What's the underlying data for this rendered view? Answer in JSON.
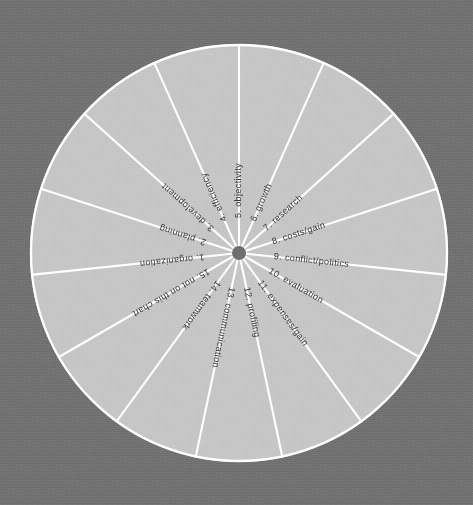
{
  "canvas": {
    "width": 473,
    "height": 505
  },
  "colors": {
    "background": "#727272",
    "wheel_fill": "#c6c6c6",
    "spoke": "#ffffff",
    "rim": "#ffffff",
    "hub": "#6e6e6e",
    "label_text": "#38383a"
  },
  "chart_data": {
    "type": "pie",
    "title": "",
    "subtitle": "",
    "xlabel": "",
    "ylabel": "",
    "legend_position": "none",
    "grid": false,
    "equal_slices": true,
    "slice_count": 15,
    "slice_angle_degrees": 24,
    "start_angle_degrees": 0,
    "center": {
      "x": 239,
      "y": 253
    },
    "radius": 209,
    "hub_radius": 7,
    "categories": [
      "1. organization",
      "2. planning",
      "3. development",
      "4. efficiency",
      "5. objectivity",
      "6. growth",
      "7. research",
      "8. costs/gain",
      "9. conflict/politics",
      "10. evaluation",
      "11. expenses/gain",
      "12. profiling",
      "13. communication",
      "14. teamwork",
      "15. not on this chart"
    ],
    "values": [
      1,
      1,
      1,
      1,
      1,
      1,
      1,
      1,
      1,
      1,
      1,
      1,
      1,
      1,
      1
    ],
    "slices": [
      {
        "number": "1.",
        "label": "organization",
        "text": "1.  organization",
        "value": 1,
        "percent": 6.67,
        "mid_angle_degrees": 264
      },
      {
        "number": "2.",
        "label": "planning",
        "text": "2.  planning",
        "value": 1,
        "percent": 6.67,
        "mid_angle_degrees": 288
      },
      {
        "number": "3.",
        "label": "development",
        "text": "3.  development",
        "value": 1,
        "percent": 6.67,
        "mid_angle_degrees": 312
      },
      {
        "number": "4.",
        "label": "efficiency",
        "text": "4.  efficiency",
        "value": 1,
        "percent": 6.67,
        "mid_angle_degrees": 336
      },
      {
        "number": "5.",
        "label": "objectivity",
        "text": "5.  objectivity",
        "value": 1,
        "percent": 6.67,
        "mid_angle_degrees": 0
      },
      {
        "number": "6.",
        "label": "growth",
        "text": "6.  growth",
        "value": 1,
        "percent": 6.67,
        "mid_angle_degrees": 24
      },
      {
        "number": "7.",
        "label": "research",
        "text": "7.  research",
        "value": 1,
        "percent": 6.67,
        "mid_angle_degrees": 48
      },
      {
        "number": "8.",
        "label": "costs/gain",
        "text": "8.  costs/gain",
        "value": 1,
        "percent": 6.67,
        "mid_angle_degrees": 72
      },
      {
        "number": "9.",
        "label": "conflict/politics",
        "text": "9.  conflict/politics",
        "value": 1,
        "percent": 6.67,
        "mid_angle_degrees": 96
      },
      {
        "number": "10.",
        "label": "evaluation",
        "text": "10.  evaluation",
        "value": 1,
        "percent": 6.67,
        "mid_angle_degrees": 120
      },
      {
        "number": "11.",
        "label": "expenses/gain",
        "text": "11.  expenses/gain",
        "value": 1,
        "percent": 6.67,
        "mid_angle_degrees": 144
      },
      {
        "number": "12.",
        "label": "profiling",
        "text": "12.  profiling",
        "value": 1,
        "percent": 6.67,
        "mid_angle_degrees": 168
      },
      {
        "number": "13.",
        "label": "communication",
        "text": "13.  communication",
        "value": 1,
        "percent": 6.67,
        "mid_angle_degrees": 192
      },
      {
        "number": "14.",
        "label": "teamwork",
        "text": "14.  teamwork",
        "value": 1,
        "percent": 6.67,
        "mid_angle_degrees": 216
      },
      {
        "number": "15.",
        "label": "not on this chart",
        "text": "15.  not on this chart",
        "value": 1,
        "percent": 6.67,
        "mid_angle_degrees": 240
      }
    ]
  }
}
